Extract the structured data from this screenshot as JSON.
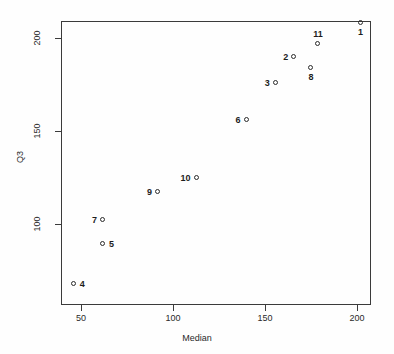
{
  "chart_data": {
    "type": "scatter",
    "title": "",
    "xlabel": "Median",
    "ylabel": "Q3",
    "xlim": [
      44,
      207
    ],
    "ylim": [
      62,
      214
    ],
    "xticks": [
      50,
      100,
      150,
      200
    ],
    "yticks": [
      100,
      150,
      200
    ],
    "xtick_labels": [
      "50",
      "100",
      "150",
      "200"
    ],
    "ytick_labels": [
      "100",
      "150",
      "200"
    ],
    "grid": false,
    "legend": null,
    "point_labels": [
      "1",
      "2",
      "3",
      "4",
      "5",
      "6",
      "7",
      "8",
      "9",
      "10",
      "11"
    ],
    "x": [
      202,
      166,
      156,
      46,
      62,
      140,
      62,
      175,
      92,
      113,
      179
    ],
    "y": [
      208,
      190,
      176,
      68,
      89,
      156,
      102,
      184,
      117,
      125,
      197
    ],
    "points": [
      {
        "label": "1",
        "x": 202,
        "y": 208,
        "label_pos": "below"
      },
      {
        "label": "2",
        "x": 166,
        "y": 190,
        "label_pos": "left"
      },
      {
        "label": "3",
        "x": 156,
        "y": 176,
        "label_pos": "left"
      },
      {
        "label": "4",
        "x": 46,
        "y": 68,
        "label_pos": "right"
      },
      {
        "label": "5",
        "x": 62,
        "y": 89,
        "label_pos": "right"
      },
      {
        "label": "6",
        "x": 140,
        "y": 156,
        "label_pos": "left"
      },
      {
        "label": "7",
        "x": 62,
        "y": 102,
        "label_pos": "left"
      },
      {
        "label": "8",
        "x": 175,
        "y": 184,
        "label_pos": "below"
      },
      {
        "label": "9",
        "x": 92,
        "y": 117,
        "label_pos": "left"
      },
      {
        "label": "10",
        "x": 113,
        "y": 125,
        "label_pos": "left"
      },
      {
        "label": "11",
        "x": 179,
        "y": 197,
        "label_pos": "above"
      }
    ]
  },
  "axes": {
    "y_title": "Q3",
    "x_title": "Median",
    "x_tick_0": "50",
    "x_tick_1": "100",
    "x_tick_2": "150",
    "x_tick_3": "200",
    "y_tick_0": "100",
    "y_tick_1": "150",
    "y_tick_2": "200"
  },
  "colors": {
    "frame": "#3b3b3b",
    "point": "#2b2b2b",
    "text": "#2a2a2a",
    "background": "#fefefe"
  }
}
